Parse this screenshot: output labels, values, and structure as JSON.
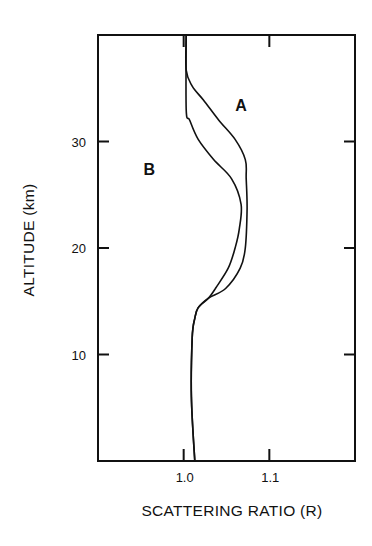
{
  "chart_data": {
    "type": "line",
    "title": "",
    "xlabel": "SCATTERING RATIO (R)",
    "ylabel": "ALTITUDE (km)",
    "xlim": [
      0.9,
      1.2
    ],
    "ylim": [
      0,
      40
    ],
    "x_ticks": [
      1.0,
      1.1
    ],
    "x_tick_labels": [
      "1.0",
      "1.1"
    ],
    "y_ticks": [
      10,
      20,
      30
    ],
    "y_tick_labels": [
      "10",
      "20",
      "30"
    ],
    "grid": false,
    "legend": "inline labels",
    "orientation": "vertical profile (x = scattering ratio, y = altitude)",
    "series": [
      {
        "name": "A",
        "label_position": {
          "x": 1.067,
          "y": 33.4
        },
        "points": [
          {
            "x": 1.003,
            "y": 40.0
          },
          {
            "x": 1.003,
            "y": 36.7
          },
          {
            "x": 1.01,
            "y": 35.2
          },
          {
            "x": 1.023,
            "y": 33.9
          },
          {
            "x": 1.041,
            "y": 32.0
          },
          {
            "x": 1.06,
            "y": 30.2
          },
          {
            "x": 1.072,
            "y": 28.3
          },
          {
            "x": 1.073,
            "y": 26.5
          },
          {
            "x": 1.074,
            "y": 23.7
          },
          {
            "x": 1.072,
            "y": 20.0
          },
          {
            "x": 1.066,
            "y": 18.1
          },
          {
            "x": 1.049,
            "y": 16.2
          },
          {
            "x": 1.029,
            "y": 15.3
          },
          {
            "x": 1.017,
            "y": 14.4
          },
          {
            "x": 1.013,
            "y": 13.4
          },
          {
            "x": 1.01,
            "y": 11.6
          },
          {
            "x": 1.009,
            "y": 6.0
          },
          {
            "x": 1.013,
            "y": 0.0
          }
        ]
      },
      {
        "name": "B",
        "label_position": {
          "x": 0.96,
          "y": 27.4
        },
        "points": [
          {
            "x": 1.003,
            "y": 40.0
          },
          {
            "x": 1.003,
            "y": 33.0
          },
          {
            "x": 1.007,
            "y": 32.0
          },
          {
            "x": 1.017,
            "y": 30.2
          },
          {
            "x": 1.035,
            "y": 28.3
          },
          {
            "x": 1.056,
            "y": 26.5
          },
          {
            "x": 1.067,
            "y": 24.1
          },
          {
            "x": 1.065,
            "y": 21.8
          },
          {
            "x": 1.06,
            "y": 20.0
          },
          {
            "x": 1.052,
            "y": 18.1
          },
          {
            "x": 1.037,
            "y": 16.2
          },
          {
            "x": 1.029,
            "y": 15.3
          },
          {
            "x": 1.017,
            "y": 14.4
          },
          {
            "x": 1.013,
            "y": 13.4
          },
          {
            "x": 1.01,
            "y": 11.6
          },
          {
            "x": 1.009,
            "y": 6.0
          },
          {
            "x": 1.013,
            "y": 0.0
          }
        ]
      }
    ]
  }
}
